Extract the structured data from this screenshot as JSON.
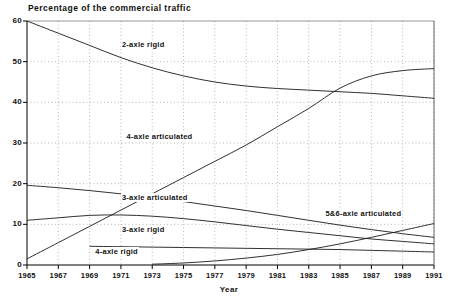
{
  "chart_data": {
    "type": "line",
    "title": "Percentage of the commercial traffic",
    "xlabel": "Year",
    "ylabel": "",
    "xlim": [
      1965,
      1991
    ],
    "ylim": [
      0,
      60
    ],
    "grid": true,
    "legend_position": "inline-labels",
    "ytick_labels": [
      "0",
      "10",
      "20",
      "30",
      "40",
      "50",
      "60"
    ],
    "ytick_values": [
      0,
      10,
      20,
      30,
      40,
      50,
      60
    ],
    "xtick_labels": [
      "1965",
      "1967",
      "1969",
      "1971",
      "1973",
      "1975",
      "1977",
      "1979",
      "1981",
      "1983",
      "1985",
      "1987",
      "1989",
      "1991"
    ],
    "xtick_values": [
      1965,
      1967,
      1969,
      1971,
      1973,
      1975,
      1977,
      1979,
      1981,
      1983,
      1985,
      1987,
      1989,
      1991
    ],
    "x": [
      1965,
      1967,
      1969,
      1971,
      1973,
      1975,
      1977,
      1979,
      1981,
      1983,
      1985,
      1987,
      1989,
      1991
    ],
    "series": [
      {
        "name": "2-axle rigid",
        "label_x": 1971.0,
        "label_y": 54.0,
        "values": [
          60.0,
          57.0,
          54.0,
          51.0,
          48.5,
          46.5,
          45.0,
          44.0,
          43.4,
          43.0,
          42.6,
          42.2,
          41.6,
          41.0
        ]
      },
      {
        "name": "4-axle articulated",
        "label_x": 1971.3,
        "label_y": 31.5,
        "values": [
          1.5,
          5.5,
          9.5,
          13.5,
          17.5,
          21.5,
          25.5,
          29.5,
          34.0,
          38.5,
          43.5,
          46.5,
          47.8,
          48.3
        ]
      },
      {
        "name": "3-axle articulated",
        "label_x": 1971.0,
        "label_y": 16.5,
        "values": [
          19.6,
          19.0,
          18.3,
          17.5,
          16.6,
          15.6,
          14.5,
          13.4,
          12.2,
          11.0,
          9.8,
          8.7,
          7.7,
          6.8
        ]
      },
      {
        "name": "3-axle rigid",
        "label_x": 1971.0,
        "label_y": 8.5,
        "values": [
          11.0,
          11.6,
          12.2,
          12.3,
          12.0,
          11.4,
          10.6,
          9.7,
          8.8,
          8.0,
          7.2,
          6.4,
          5.8,
          5.2
        ]
      },
      {
        "name": "4-axle rigid",
        "label_x": 1969.3,
        "label_y": 3.2,
        "values": [
          null,
          null,
          4.6,
          4.5,
          4.4,
          4.3,
          4.2,
          4.1,
          4.0,
          3.9,
          3.8,
          3.6,
          3.4,
          3.2
        ]
      },
      {
        "name": "5&6-axle articulated",
        "label_x": 1984.0,
        "label_y": 12.6,
        "values": [
          null,
          null,
          null,
          null,
          0.2,
          0.5,
          1.0,
          1.7,
          2.6,
          3.8,
          5.2,
          6.8,
          8.5,
          10.2
        ]
      }
    ]
  }
}
